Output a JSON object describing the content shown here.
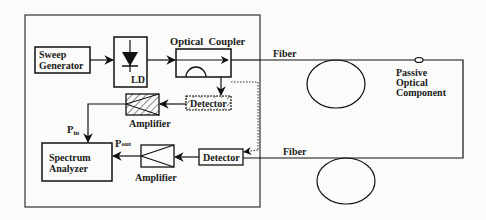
{
  "diagram": {
    "blocks": {
      "sweep_generator": {
        "line1": "Sweep",
        "line2": "Generator"
      },
      "laser_diode": {
        "label": "LD"
      },
      "optical_coupler": {
        "label": "Optical  Coupler"
      },
      "detector_ref": {
        "label": "Detector"
      },
      "amplifier_ref": {
        "label": "Amplifier"
      },
      "spectrum_analyzer": {
        "line1": "Spectrum",
        "line2": "Analyzer"
      },
      "amplifier_out": {
        "label": "Amplifier"
      },
      "detector_out": {
        "label": "Detector"
      },
      "passive_component": {
        "line1": "Passive",
        "line2": "Optical",
        "line3": "Component"
      }
    },
    "signals": {
      "p_in": {
        "main": "P",
        "sub": "in"
      },
      "p_out": {
        "main": "P",
        "sub": "out"
      }
    },
    "fiber_labels": {
      "top": "Fiber",
      "bottom": "Fiber"
    }
  }
}
